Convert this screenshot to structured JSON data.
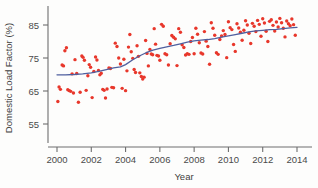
{
  "chart_data": {
    "type": "scatter",
    "title": "",
    "subtitle": "",
    "xlabel": "Year",
    "ylabel": "Domestic Load Factor (%)",
    "xlim": [
      1999.4,
      2014.6
    ],
    "ylim": [
      51.5,
      89.5
    ],
    "xticks": [
      2000,
      2002,
      2004,
      2006,
      2008,
      2010,
      2012,
      2014
    ],
    "xtick_labels": [
      "2000",
      "2002",
      "2004",
      "2006",
      "2008",
      "2010",
      "2012",
      "2014"
    ],
    "yticks": [
      55,
      65,
      75,
      85
    ],
    "ytick_labels": [
      "55",
      "65",
      "75",
      "85"
    ],
    "grid": false,
    "legend": "none",
    "point_color": "#e8372b",
    "line_color": "#4f5f9e",
    "axis_color": "#6e6e6e",
    "series": [
      {
        "name": "Monthly domestic load factor",
        "marker": "circle",
        "points": [
          [
            2000.05,
            61.8
          ],
          [
            2000.12,
            66.2
          ],
          [
            2000.2,
            65.5
          ],
          [
            2000.3,
            72.9
          ],
          [
            2000.38,
            72.6
          ],
          [
            2000.46,
            77.2
          ],
          [
            2000.55,
            78.1
          ],
          [
            2000.63,
            65.4
          ],
          [
            2000.72,
            65.1
          ],
          [
            2000.8,
            64.9
          ],
          [
            2000.88,
            70.2
          ],
          [
            2000.96,
            64.4
          ],
          [
            2001.05,
            74.5
          ],
          [
            2001.15,
            70.3
          ],
          [
            2001.25,
            61.6
          ],
          [
            2001.35,
            64.6
          ],
          [
            2001.45,
            75.6
          ],
          [
            2001.52,
            75.2
          ],
          [
            2001.6,
            74.3
          ],
          [
            2001.7,
            65.2
          ],
          [
            2001.8,
            69.6
          ],
          [
            2001.88,
            73.0
          ],
          [
            2001.96,
            72.2
          ],
          [
            2002.05,
            63.0
          ],
          [
            2002.15,
            70.9
          ],
          [
            2002.25,
            75.3
          ],
          [
            2002.33,
            74.4
          ],
          [
            2002.42,
            71.2
          ],
          [
            2002.5,
            69.9
          ],
          [
            2002.58,
            70.4
          ],
          [
            2002.67,
            65.5
          ],
          [
            2002.75,
            65.2
          ],
          [
            2002.83,
            62.9
          ],
          [
            2002.92,
            65.6
          ],
          [
            2003.03,
            72.0
          ],
          [
            2003.12,
            71.8
          ],
          [
            2003.2,
            66.1
          ],
          [
            2003.3,
            66.0
          ],
          [
            2003.4,
            79.5
          ],
          [
            2003.5,
            78.5
          ],
          [
            2003.6,
            75.0
          ],
          [
            2003.7,
            73.2
          ],
          [
            2003.8,
            65.8
          ],
          [
            2003.9,
            74.6
          ],
          [
            2004.0,
            65.1
          ],
          [
            2004.08,
            71.1
          ],
          [
            2004.17,
            78.3
          ],
          [
            2004.25,
            82.1
          ],
          [
            2004.33,
            76.9
          ],
          [
            2004.42,
            74.9
          ],
          [
            2004.5,
            71.5
          ],
          [
            2004.58,
            70.6
          ],
          [
            2004.67,
            78.7
          ],
          [
            2004.75,
            75.5
          ],
          [
            2004.83,
            70.5
          ],
          [
            2004.92,
            69.4
          ],
          [
            2005.0,
            68.6
          ],
          [
            2005.08,
            69.2
          ],
          [
            2005.17,
            80.3
          ],
          [
            2005.25,
            76.4
          ],
          [
            2005.33,
            72.6
          ],
          [
            2005.42,
            77.6
          ],
          [
            2005.5,
            76.2
          ],
          [
            2005.58,
            76.0
          ],
          [
            2005.67,
            83.9
          ],
          [
            2005.75,
            79.2
          ],
          [
            2005.83,
            75.8
          ],
          [
            2005.92,
            75.6
          ],
          [
            2006.0,
            74.3
          ],
          [
            2006.1,
            85.2
          ],
          [
            2006.2,
            84.6
          ],
          [
            2006.3,
            76.3
          ],
          [
            2006.4,
            76.0
          ],
          [
            2006.5,
            72.9
          ],
          [
            2006.6,
            79.3
          ],
          [
            2006.7,
            81.8
          ],
          [
            2006.8,
            81.3
          ],
          [
            2006.9,
            80.8
          ],
          [
            2007.0,
            72.7
          ],
          [
            2007.1,
            83.9
          ],
          [
            2007.2,
            82.8
          ],
          [
            2007.3,
            79.0
          ],
          [
            2007.4,
            78.2
          ],
          [
            2007.5,
            75.9
          ],
          [
            2007.6,
            76.3
          ],
          [
            2007.7,
            76.1
          ],
          [
            2007.8,
            80.0
          ],
          [
            2007.9,
            81.2
          ],
          [
            2008.0,
            76.3
          ],
          [
            2008.1,
            84.0
          ],
          [
            2008.2,
            82.2
          ],
          [
            2008.3,
            79.6
          ],
          [
            2008.4,
            76.5
          ],
          [
            2008.5,
            76.2
          ],
          [
            2008.6,
            83.0
          ],
          [
            2008.7,
            80.1
          ],
          [
            2008.8,
            78.5
          ],
          [
            2008.9,
            73.1
          ],
          [
            2009.0,
            85.7
          ],
          [
            2009.1,
            84.0
          ],
          [
            2009.2,
            81.9
          ],
          [
            2009.3,
            76.6
          ],
          [
            2009.4,
            76.1
          ],
          [
            2009.5,
            80.6
          ],
          [
            2009.6,
            81.7
          ],
          [
            2009.7,
            83.3
          ],
          [
            2009.8,
            82.1
          ],
          [
            2009.9,
            75.1
          ],
          [
            2010.0,
            86.0
          ],
          [
            2010.1,
            84.2
          ],
          [
            2010.2,
            83.6
          ],
          [
            2010.3,
            79.1
          ],
          [
            2010.4,
            77.0
          ],
          [
            2010.5,
            85.4
          ],
          [
            2010.6,
            84.1
          ],
          [
            2010.7,
            82.8
          ],
          [
            2010.8,
            80.4
          ],
          [
            2010.9,
            83.4
          ],
          [
            2011.0,
            86.3
          ],
          [
            2011.1,
            85.0
          ],
          [
            2011.2,
            82.5
          ],
          [
            2011.3,
            79.4
          ],
          [
            2011.4,
            85.5
          ],
          [
            2011.5,
            84.6
          ],
          [
            2011.6,
            83.0
          ],
          [
            2011.7,
            86.4
          ],
          [
            2011.8,
            85.2
          ],
          [
            2011.9,
            81.6
          ],
          [
            2012.0,
            86.9
          ],
          [
            2012.1,
            85.6
          ],
          [
            2012.2,
            83.1
          ],
          [
            2012.3,
            80.0
          ],
          [
            2012.4,
            86.1
          ],
          [
            2012.5,
            86.6
          ],
          [
            2012.6,
            84.9
          ],
          [
            2012.7,
            83.2
          ],
          [
            2012.8,
            85.9
          ],
          [
            2012.9,
            84.4
          ],
          [
            2013.0,
            87.0
          ],
          [
            2013.1,
            85.7
          ],
          [
            2013.2,
            84.0
          ],
          [
            2013.3,
            81.4
          ],
          [
            2013.4,
            86.2
          ],
          [
            2013.5,
            85.4
          ],
          [
            2013.6,
            84.8
          ],
          [
            2013.7,
            86.8
          ],
          [
            2013.8,
            85.1
          ],
          [
            2013.9,
            81.9
          ]
        ]
      }
    ],
    "smooth_fit": {
      "name": "loess smooth",
      "points": [
        [
          2000.0,
          69.9
        ],
        [
          2000.5,
          69.9
        ],
        [
          2001.0,
          70.0
        ],
        [
          2001.5,
          70.2
        ],
        [
          2002.0,
          70.5
        ],
        [
          2002.5,
          71.0
        ],
        [
          2003.0,
          71.6
        ],
        [
          2003.3,
          72.0
        ],
        [
          2003.7,
          72.3
        ],
        [
          2004.0,
          73.0
        ],
        [
          2004.4,
          74.4
        ],
        [
          2004.8,
          75.6
        ],
        [
          2005.2,
          76.6
        ],
        [
          2005.6,
          77.4
        ],
        [
          2006.0,
          77.9
        ],
        [
          2006.4,
          78.4
        ],
        [
          2006.8,
          78.8
        ],
        [
          2007.2,
          79.3
        ],
        [
          2007.6,
          79.8
        ],
        [
          2008.0,
          80.2
        ],
        [
          2008.4,
          80.4
        ],
        [
          2008.8,
          80.6
        ],
        [
          2009.2,
          80.9
        ],
        [
          2009.6,
          81.3
        ],
        [
          2010.0,
          81.7
        ],
        [
          2010.4,
          82.1
        ],
        [
          2010.8,
          82.5
        ],
        [
          2011.2,
          82.9
        ],
        [
          2011.6,
          83.2
        ],
        [
          2012.0,
          83.4
        ],
        [
          2012.4,
          83.6
        ],
        [
          2012.8,
          83.7
        ],
        [
          2013.2,
          83.9
        ],
        [
          2013.6,
          84.1
        ],
        [
          2014.0,
          84.3
        ]
      ]
    }
  }
}
